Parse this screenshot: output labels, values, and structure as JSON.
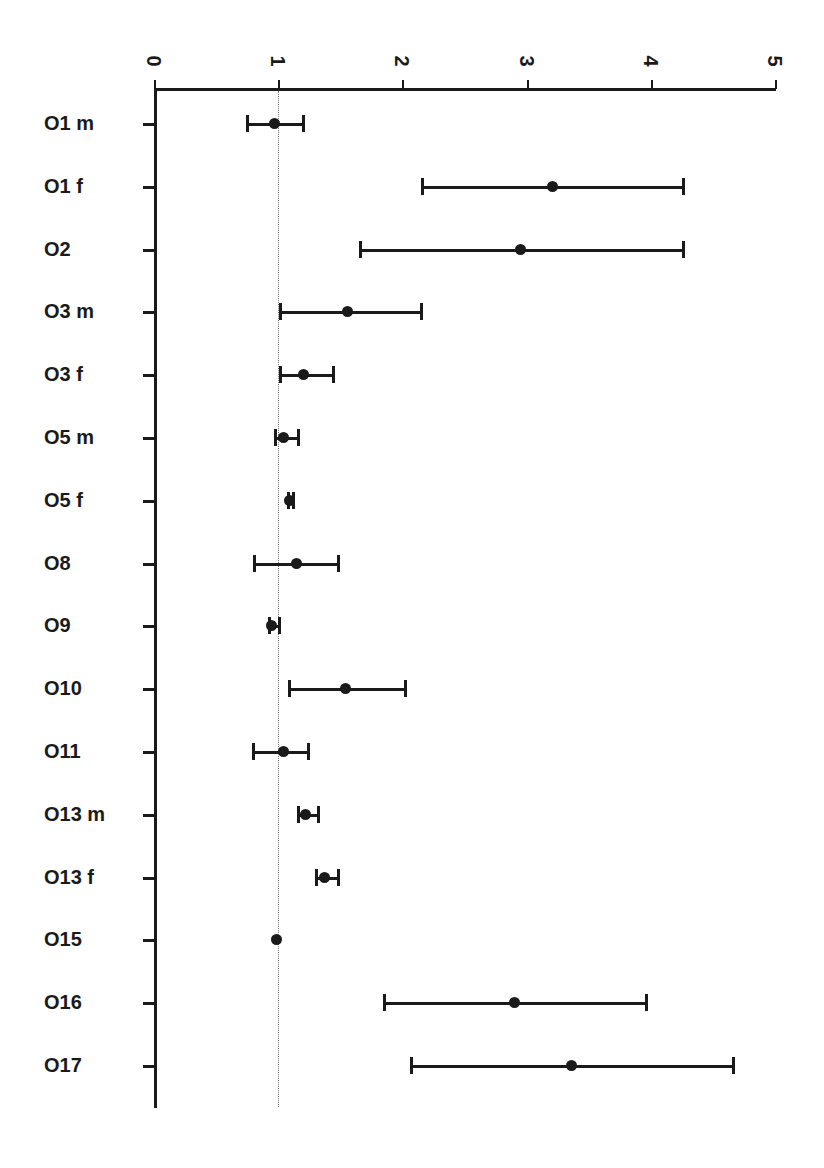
{
  "chart_data": {
    "type": "scatter",
    "subtype": "forest-plot",
    "title": "",
    "xlabel": "",
    "ylabel": "",
    "xlim": [
      0,
      5
    ],
    "xticks": [
      0,
      1,
      2,
      3,
      4
    ],
    "xtick_labels": [
      "0",
      "1",
      "2",
      "3",
      "4",
      "5"
    ],
    "xticks_all": [
      0,
      1,
      2,
      3,
      4,
      5
    ],
    "grid": false,
    "legend": "none",
    "reference_line": 1,
    "reference_line_style": "dotted",
    "marker": "filled-circle",
    "color": "#1a1a1a",
    "categories": [
      "O1 m",
      "O1 f",
      "O2",
      "O3 m",
      "O3 f",
      "O5 m",
      "O5 f",
      "O8",
      "O9",
      "O10",
      "O11",
      "O13 m",
      "O13 f",
      "O15",
      "O16",
      "O17"
    ],
    "values": [
      0.97,
      3.21,
      2.95,
      1.56,
      1.2,
      1.04,
      1.09,
      1.15,
      0.95,
      1.54,
      1.04,
      1.22,
      1.37,
      0.99,
      2.9,
      3.36
    ],
    "ci_lower": [
      0.74,
      2.15,
      1.65,
      1.01,
      1.01,
      0.97,
      1.07,
      0.8,
      0.92,
      1.08,
      0.79,
      1.15,
      1.3,
      0.98,
      1.84,
      2.06
    ],
    "ci_upper": [
      1.19,
      4.25,
      4.25,
      2.14,
      1.43,
      1.15,
      1.11,
      1.47,
      1.0,
      2.01,
      1.23,
      1.31,
      1.47,
      1.01,
      3.95,
      4.65
    ],
    "points": [
      {
        "label": "O1 m",
        "estimate": 0.97,
        "lower": 0.74,
        "upper": 1.19
      },
      {
        "label": "O1 f",
        "estimate": 3.21,
        "lower": 2.15,
        "upper": 4.25
      },
      {
        "label": "O2",
        "estimate": 2.95,
        "lower": 1.65,
        "upper": 4.25
      },
      {
        "label": "O3 m",
        "estimate": 1.56,
        "lower": 1.01,
        "upper": 2.14
      },
      {
        "label": "O3 f",
        "estimate": 1.2,
        "lower": 1.01,
        "upper": 1.43
      },
      {
        "label": "O5 m",
        "estimate": 1.04,
        "lower": 0.97,
        "upper": 1.15
      },
      {
        "label": "O5 f",
        "estimate": 1.09,
        "lower": 1.07,
        "upper": 1.11
      },
      {
        "label": "O8",
        "estimate": 1.15,
        "lower": 0.8,
        "upper": 1.47
      },
      {
        "label": "O9",
        "estimate": 0.95,
        "lower": 0.92,
        "upper": 1.0
      },
      {
        "label": "O10",
        "estimate": 1.54,
        "lower": 1.08,
        "upper": 2.01
      },
      {
        "label": "O11",
        "estimate": 1.04,
        "lower": 0.79,
        "upper": 1.23
      },
      {
        "label": "O13 m",
        "estimate": 1.22,
        "lower": 1.15,
        "upper": 1.31
      },
      {
        "label": "O13 f",
        "estimate": 1.37,
        "lower": 1.3,
        "upper": 1.47
      },
      {
        "label": "O15",
        "estimate": 0.99,
        "lower": 0.98,
        "upper": 1.01
      },
      {
        "label": "O16",
        "estimate": 2.9,
        "lower": 1.84,
        "upper": 3.95
      },
      {
        "label": "O17",
        "estimate": 3.36,
        "lower": 2.06,
        "upper": 4.65
      }
    ]
  },
  "axis": {
    "x_origin_px": 154,
    "px_per_unit": 124.2,
    "first_row_y_px": 123,
    "row_spacing_px": 62.8
  }
}
